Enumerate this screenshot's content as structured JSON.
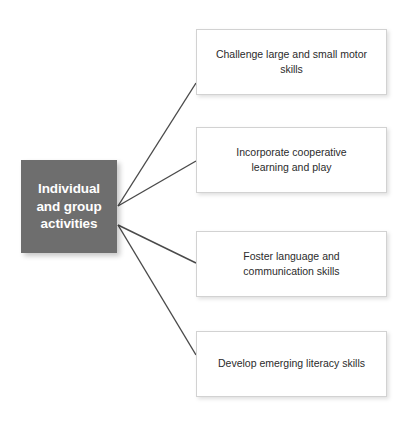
{
  "diagram": {
    "type": "hub-and-spoke",
    "background_color": "#ffffff",
    "central_node": {
      "label": "Individual\nand group\nactivities",
      "fill_color": "#6e6e6e",
      "text_color": "#ffffff"
    },
    "connector_color": "#4a4a4a",
    "branches": [
      {
        "label": "Challenge large and small motor skills",
        "fill_color": "#ffffff",
        "border_color": "#d2d2d2",
        "text_color": "#2b2b2b"
      },
      {
        "label": "Incorporate cooperative\nlearning and play",
        "fill_color": "#ffffff",
        "border_color": "#d2d2d2",
        "text_color": "#2b2b2b"
      },
      {
        "label": "Foster language and\ncommunication skills",
        "fill_color": "#ffffff",
        "border_color": "#d2d2d2",
        "text_color": "#2b2b2b"
      },
      {
        "label": "Develop emerging literacy skills",
        "fill_color": "#ffffff",
        "border_color": "#d2d2d2",
        "text_color": "#2b2b2b"
      }
    ]
  }
}
